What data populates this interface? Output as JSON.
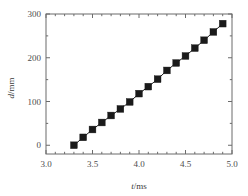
{
  "chart_data": {
    "type": "scatter",
    "title": "",
    "subtitle": "",
    "xlabel": "t/ms",
    "xlabel_italic_part": "t",
    "xlabel_rest": "/ms",
    "ylabel": "d/mm",
    "ylabel_italic_part": "d",
    "ylabel_rest": "/mm",
    "xlim": [
      3.0,
      5.0
    ],
    "ylim": [
      -20,
      300
    ],
    "xticks": [
      3.0,
      3.5,
      4.0,
      4.5,
      5.0
    ],
    "xticklabels": [
      "3.0",
      "3.5",
      "4.0",
      "4.5",
      "5.0"
    ],
    "yticks": [
      0,
      100,
      200,
      300
    ],
    "yticklabels": [
      "0",
      "100",
      "200",
      "300"
    ],
    "x_minor_ticks": [
      3.1,
      3.2,
      3.3,
      3.4,
      3.6,
      3.7,
      3.8,
      3.9,
      4.1,
      4.2,
      4.3,
      4.4,
      4.6,
      4.7,
      4.8,
      4.9
    ],
    "y_minor_ticks": [
      50,
      150,
      250
    ],
    "grid": false,
    "legend": false,
    "legend_position": "none",
    "marker_style": "filled-square",
    "marker_color": "#1a1a1a",
    "line_color": "#1a1a1a",
    "frame": true,
    "x": [
      3.3,
      3.4,
      3.5,
      3.6,
      3.7,
      3.8,
      3.9,
      4.0,
      4.1,
      4.2,
      4.3,
      4.4,
      4.5,
      4.6,
      4.7,
      4.8,
      4.9
    ],
    "values": [
      0,
      18,
      36,
      52,
      68,
      83,
      99,
      118,
      134,
      151,
      171,
      188,
      204,
      222,
      240,
      259,
      278
    ],
    "series": [
      {
        "name": "d vs t",
        "x": [
          3.3,
          3.4,
          3.5,
          3.6,
          3.7,
          3.8,
          3.9,
          4.0,
          4.1,
          4.2,
          4.3,
          4.4,
          4.5,
          4.6,
          4.7,
          4.8,
          4.9
        ],
        "values": [
          0,
          18,
          36,
          52,
          68,
          83,
          99,
          118,
          134,
          151,
          171,
          188,
          204,
          222,
          240,
          259,
          278
        ]
      }
    ]
  }
}
